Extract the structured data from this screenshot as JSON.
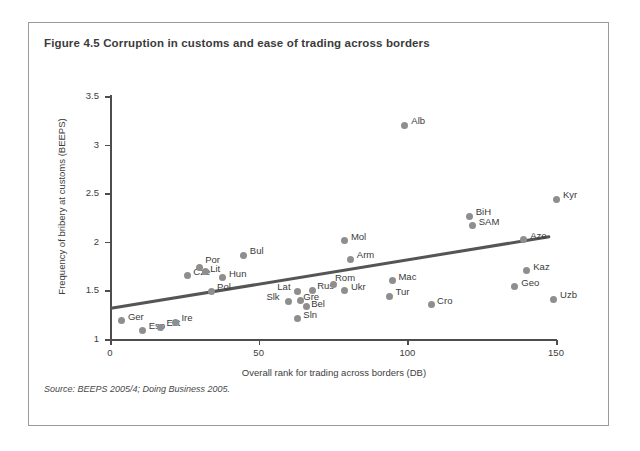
{
  "figure": {
    "title": "Figure 4.5  Corruption in customs and ease of trading across borders",
    "source": "Source: BEEPS 2005/4; Doing Business 2005."
  },
  "chart_data": {
    "type": "scatter",
    "title": "Figure 4.5  Corruption in customs and ease of trading across borders",
    "xlabel": "Overall rank for trading across borders (DB)",
    "ylabel": "Frequency of bribery at customs (BEEPS)",
    "xlim": [
      0,
      155
    ],
    "ylim": [
      0.9,
      3.6
    ],
    "xticks": [
      0,
      50,
      100,
      150
    ],
    "yticks": [
      1,
      1.5,
      2,
      2.5,
      3,
      3.5
    ],
    "xtick_labels": [
      "0",
      "50",
      "100",
      "150"
    ],
    "ytick_labels": [
      "1",
      "1.5",
      "2",
      "2.5",
      "3",
      "3.5"
    ],
    "grid": false,
    "legend": null,
    "marker_color": "#8e8e8e",
    "trendline_color": "#555555",
    "trendline": {
      "x_start": 0,
      "y_start": 1.31,
      "x_end": 148,
      "y_end": 2.05
    },
    "points": [
      {
        "label": "Ger",
        "x": 4,
        "y": 1.19
      },
      {
        "label": "Esp",
        "x": 11,
        "y": 1.09
      },
      {
        "label": "Est",
        "x": 17,
        "y": 1.12
      },
      {
        "label": "Ire",
        "x": 22,
        "y": 1.17
      },
      {
        "label": "Cze",
        "x": 26,
        "y": 1.65
      },
      {
        "label": "Por",
        "x": 30,
        "y": 1.74
      },
      {
        "label": "Lit",
        "x": 32,
        "y": 1.69
      },
      {
        "label": "Hun",
        "x": 38,
        "y": 1.63
      },
      {
        "label": "Pol",
        "x": 34,
        "y": 1.49
      },
      {
        "label": "Bul",
        "x": 45,
        "y": 1.86
      },
      {
        "label": "Slk",
        "x": 60,
        "y": 1.39
      },
      {
        "label": "Lat",
        "x": 63,
        "y": 1.49
      },
      {
        "label": "Gre",
        "x": 64,
        "y": 1.4
      },
      {
        "label": "Bel",
        "x": 66,
        "y": 1.33
      },
      {
        "label": "Sln",
        "x": 63,
        "y": 1.21
      },
      {
        "label": "Rus",
        "x": 68,
        "y": 1.5
      },
      {
        "label": "Rom",
        "x": 75,
        "y": 1.56
      },
      {
        "label": "Ukr",
        "x": 79,
        "y": 1.5
      },
      {
        "label": "Mol",
        "x": 79,
        "y": 2.01
      },
      {
        "label": "Arm",
        "x": 81,
        "y": 1.82
      },
      {
        "label": "Alb",
        "x": 99,
        "y": 3.2
      },
      {
        "label": "Mac",
        "x": 95,
        "y": 1.6
      },
      {
        "label": "Tur",
        "x": 94,
        "y": 1.44
      },
      {
        "label": "Cro",
        "x": 108,
        "y": 1.35
      },
      {
        "label": "BiH",
        "x": 121,
        "y": 2.26
      },
      {
        "label": "SAM",
        "x": 122,
        "y": 2.17
      },
      {
        "label": "Kyr",
        "x": 150,
        "y": 2.44
      },
      {
        "label": "Aze",
        "x": 139,
        "y": 2.02
      },
      {
        "label": "Kaz",
        "x": 140,
        "y": 1.7
      },
      {
        "label": "Geo",
        "x": 136,
        "y": 1.54
      },
      {
        "label": "Uzb",
        "x": 149,
        "y": 1.41
      }
    ],
    "label_offsets": {
      "Ger": [
        6,
        -4
      ],
      "Esp": [
        6,
        -4
      ],
      "Est": [
        6,
        -4
      ],
      "Ire": [
        6,
        -4
      ],
      "Cze": [
        6,
        -4
      ],
      "Por": [
        6,
        -7
      ],
      "Lit": [
        5,
        -3
      ],
      "Hun": [
        6,
        -4
      ],
      "Pol": [
        6,
        -4
      ],
      "Bul": [
        6,
        -4
      ],
      "Slk": [
        -22,
        -4
      ],
      "Lat": [
        -20,
        -4
      ],
      "Gre": [
        3,
        -3
      ],
      "Bel": [
        5,
        -3
      ],
      "Sln": [
        6,
        -4
      ],
      "Rus": [
        5,
        -4
      ],
      "Rom": [
        2,
        -7
      ],
      "Ukr": [
        6,
        -3
      ],
      "Mol": [
        6,
        -4
      ],
      "Arm": [
        6,
        -4
      ],
      "Alb": [
        7,
        -4
      ],
      "Mac": [
        6,
        -4
      ],
      "Tur": [
        6,
        -4
      ],
      "Cro": [
        6,
        -4
      ],
      "BiH": [
        6,
        -5
      ],
      "SAM": [
        6,
        -3
      ],
      "Kyr": [
        7,
        -4
      ],
      "Aze": [
        7,
        -4
      ],
      "Kaz": [
        7,
        -4
      ],
      "Geo": [
        7,
        -4
      ],
      "Uzb": [
        7,
        -4
      ]
    }
  }
}
